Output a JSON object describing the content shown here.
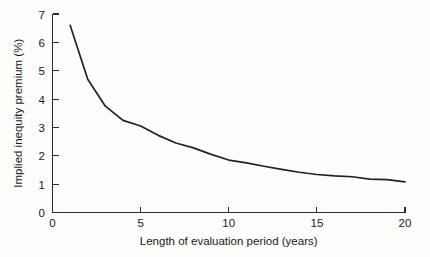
{
  "chart_data": {
    "type": "line",
    "title": "",
    "xlabel": "Length of evaluation period (years)",
    "ylabel": "Implied inequity premium (%)",
    "xlim": [
      0,
      20
    ],
    "ylim": [
      0,
      7
    ],
    "xticks": [
      0,
      5,
      10,
      15,
      20
    ],
    "yticks": [
      0,
      1,
      2,
      3,
      4,
      5,
      6,
      7
    ],
    "xtick_labels": [
      "0",
      "5",
      "10",
      "15",
      "20"
    ],
    "ytick_labels": [
      "0",
      "1",
      "2",
      "3",
      "4",
      "5",
      "6",
      "7"
    ],
    "grid": false,
    "legend": null,
    "series": [
      {
        "name": "Implied inequity premium",
        "x": [
          1,
          2,
          3,
          4,
          5,
          6,
          7,
          8,
          9,
          10,
          11,
          12,
          13,
          14,
          15,
          16,
          17,
          18,
          19,
          20
        ],
        "values": [
          6.6,
          4.7,
          3.75,
          3.25,
          3.05,
          2.72,
          2.45,
          2.28,
          2.05,
          1.85,
          1.75,
          1.63,
          1.52,
          1.42,
          1.34,
          1.29,
          1.26,
          1.18,
          1.16,
          1.08
        ]
      }
    ]
  },
  "axes": {
    "y_axis_title": "Implied inequity premium (%)",
    "x_axis_title": "Length of evaluation period (years)"
  }
}
